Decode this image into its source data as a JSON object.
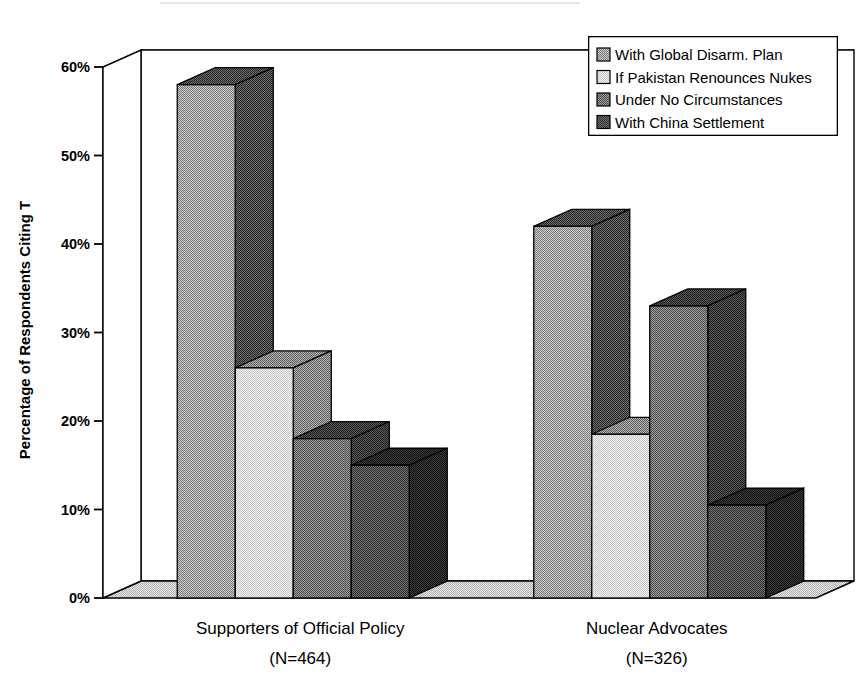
{
  "chart_data": {
    "type": "bar",
    "title": "",
    "subtitle": "",
    "xlabel": "",
    "ylabel": "Percentage of Respondents Citing T",
    "categories": [
      "Supporters of Official Policy",
      "Nuclear Advocates"
    ],
    "category_sublabels": [
      "(N=464)",
      "(N=326)"
    ],
    "series": [
      {
        "name": "With Global Disarm. Plan",
        "values": [
          58,
          42
        ],
        "color": "#a8a8a8",
        "side_color": "#4a4a4a",
        "top_color": "#8a8a8a"
      },
      {
        "name": "If Pakistan Renounces Nukes",
        "values": [
          26,
          18.5
        ],
        "color": "#e2e2e2",
        "side_color": "#8c8c8c",
        "top_color": "#cfcfcf"
      },
      {
        "name": "Under No Circumstances",
        "values": [
          18,
          33
        ],
        "color": "#7c7c7c",
        "side_color": "#3a3a3a",
        "top_color": "#666666"
      },
      {
        "name": "With China Settlement",
        "values": [
          15,
          10.5
        ],
        "color": "#5c5c5c",
        "side_color": "#262626",
        "top_color": "#474747"
      }
    ],
    "ylim": [
      0,
      60
    ],
    "ytick_values": [
      0,
      10,
      20,
      30,
      40,
      50,
      60
    ],
    "ytick_labels": [
      "0%",
      "10%",
      "20%",
      "30%",
      "40%",
      "50%",
      "60%"
    ],
    "grid": true,
    "legend_position": "top-right",
    "style": "3d-column",
    "units": "percent"
  },
  "legend": {
    "items": [
      {
        "label": "With Global Disarm. Plan",
        "swatch": "legend-swatch-series-1"
      },
      {
        "label": "If Pakistan Renounces Nukes",
        "swatch": "legend-swatch-series-2"
      },
      {
        "label": "Under No Circumstances",
        "swatch": "legend-swatch-series-3"
      },
      {
        "label": "With China Settlement",
        "swatch": "legend-swatch-series-4"
      }
    ]
  },
  "axis": {
    "y_title": "Percentage of Respondents Citing T",
    "ticks": [
      "60%",
      "50%",
      "40%",
      "30%",
      "20%",
      "10%",
      "0%"
    ]
  },
  "xaxis": {
    "groups": [
      {
        "name": "Supporters of Official Policy",
        "n": "(N=464)"
      },
      {
        "name": "Nuclear Advocates",
        "n": "(N=326)"
      }
    ]
  }
}
